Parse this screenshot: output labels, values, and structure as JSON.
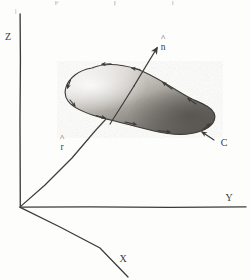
{
  "figure": {
    "background_color": "#fdfdfc",
    "ink_color": "#3d3b38"
  },
  "axes": {
    "z": {
      "label": "Z"
    },
    "y": {
      "label": "Y"
    },
    "x": {
      "label": "X"
    },
    "origin_label": ""
  },
  "vectors": {
    "normal": {
      "symbol": "n",
      "hat": "^",
      "label": "n"
    },
    "position": {
      "symbol": "r",
      "hat": "^",
      "label": "r"
    }
  },
  "curve": {
    "label": "C",
    "orientation": "counterclockwise"
  },
  "surface": {
    "fill_light": "#e9e7e3",
    "fill_dark": "#6f6c68",
    "stroke": "#3d3b38"
  }
}
